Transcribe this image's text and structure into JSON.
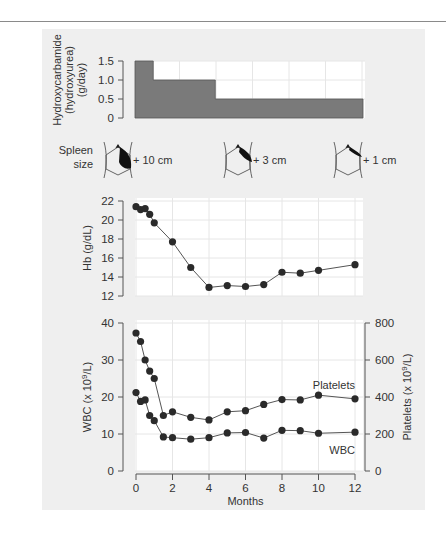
{
  "figure": {
    "colors": {
      "panel_bg": "#efefef",
      "plot_bg": "#ffffff",
      "grid": "#e6e6e6",
      "bar_fill": "#7a7a7a",
      "marker": "#2a2a2a",
      "line": "#555555",
      "axis": "#555555",
      "text": "#333333",
      "spleen_fill": "#111111"
    }
  },
  "chart_data": [
    {
      "type": "bar",
      "subtype": "step",
      "title": "",
      "ylabel_lines": [
        "Hydroxycarbamide",
        "(hydroxyurea)",
        "(g/day)"
      ],
      "ylim": [
        0,
        1.5
      ],
      "yticks": [
        "0",
        "0.5",
        "1.0",
        "1.5"
      ],
      "xlim": [
        0,
        12
      ],
      "segments": [
        {
          "x_start": 0,
          "x_end": 1,
          "dose": 1.5
        },
        {
          "x_start": 1,
          "x_end": 4.4,
          "dose": 1.0
        },
        {
          "x_start": 4.4,
          "x_end": 12.5,
          "dose": 0.5
        }
      ]
    },
    {
      "type": "table",
      "title": "Spleen size",
      "label_lines": [
        "Spleen",
        "size"
      ],
      "entries": [
        {
          "month": 0,
          "label": "+ 10 cm",
          "size_cm": 10
        },
        {
          "month": 5.5,
          "label": "+ 3 cm",
          "size_cm": 3
        },
        {
          "month": 11.5,
          "label": "+ 1 cm",
          "size_cm": 1
        }
      ]
    },
    {
      "type": "line",
      "ylabel": "Hb (g/dL)",
      "ylim": [
        12,
        22
      ],
      "yticks": [
        "12",
        "14",
        "16",
        "18",
        "20",
        "22"
      ],
      "xlim": [
        0,
        12
      ],
      "grid": true,
      "series": [
        {
          "name": "Hb",
          "x": [
            0,
            0.25,
            0.5,
            0.75,
            1,
            2,
            3,
            4,
            5,
            6,
            7,
            8,
            9,
            10,
            12
          ],
          "values": [
            21.4,
            21.1,
            21.2,
            20.6,
            19.7,
            17.7,
            15.0,
            12.9,
            13.1,
            13.0,
            13.2,
            14.5,
            14.4,
            14.7,
            15.3
          ]
        }
      ]
    },
    {
      "type": "line",
      "xlabel": "Months",
      "ylabel": "WBC (x 10^9/L)",
      "ylabel_right": "Platelets (x 10^9/L)",
      "ylim": [
        0,
        40
      ],
      "ylim_right": [
        0,
        800
      ],
      "yticks": [
        "0",
        "10",
        "20",
        "30",
        "40"
      ],
      "yticks_right": [
        "0",
        "200",
        "400",
        "600",
        "800"
      ],
      "xticks": [
        "0",
        "2",
        "4",
        "6",
        "8",
        "10",
        "12"
      ],
      "xlim": [
        0,
        12
      ],
      "grid": true,
      "series": [
        {
          "name": "Platelets",
          "axis": "right",
          "x": [
            0,
            0.25,
            0.5,
            0.75,
            1,
            1.5,
            2,
            3,
            4,
            5,
            6,
            7,
            8,
            9,
            10,
            12
          ],
          "values": [
            746,
            700,
            600,
            540,
            500,
            300,
            320,
            290,
            276,
            320,
            326,
            360,
            386,
            384,
            410,
            390
          ]
        },
        {
          "name": "WBC",
          "axis": "left",
          "x": [
            0,
            0.25,
            0.5,
            0.75,
            1,
            1.5,
            2,
            3,
            4,
            5,
            6,
            7,
            8,
            9,
            10,
            12
          ],
          "values": [
            21.2,
            18.8,
            19.2,
            15.0,
            13.6,
            9.2,
            9.0,
            8.6,
            9.0,
            10.3,
            10.4,
            8.9,
            11.0,
            10.9,
            10.2,
            10.5
          ]
        }
      ],
      "annotations": [
        {
          "text": "Platelets",
          "near": "platelets-series"
        },
        {
          "text": "WBC",
          "near": "wbc-series"
        }
      ]
    }
  ]
}
